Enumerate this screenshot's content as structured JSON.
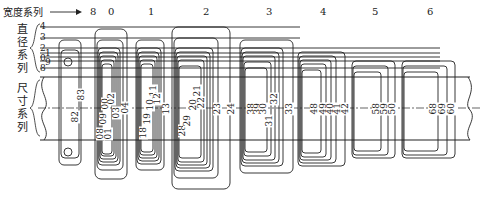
{
  "header": {
    "width_series_label": "宽度系列",
    "arrow": "→",
    "width_series": [
      "8",
      "0",
      "1",
      "2",
      "3",
      "4",
      "5",
      "6"
    ]
  },
  "left_labels": {
    "diameter_series_label": [
      "直",
      "径",
      "系",
      "列"
    ],
    "diameter_series_values": [
      "4",
      "3",
      "2",
      "1",
      "0",
      "9",
      "8"
    ],
    "dimension_series_label": [
      "尺",
      "寸",
      "系",
      "列"
    ]
  },
  "groups": [
    {
      "width": "8",
      "codes": [
        "82",
        "83"
      ]
    },
    {
      "width": "0",
      "codes": [
        "08",
        "09",
        "00",
        "01",
        "02",
        "03",
        "04"
      ]
    },
    {
      "width": "1",
      "codes": [
        "18",
        "19",
        "10",
        "11",
        "12",
        "13"
      ]
    },
    {
      "width": "2",
      "codes": [
        "28",
        "29",
        "20",
        "21",
        "22",
        "23",
        "24"
      ]
    },
    {
      "width": "3",
      "codes": [
        "38",
        "39",
        "30",
        "31",
        "32",
        "33"
      ]
    },
    {
      "width": "4",
      "codes": [
        "48",
        "49",
        "40",
        "41",
        "42"
      ]
    },
    {
      "width": "5",
      "codes": [
        "58",
        "59",
        "50"
      ]
    },
    {
      "width": "6",
      "codes": [
        "68",
        "69",
        "60"
      ]
    }
  ],
  "colors": {
    "line": "#222222",
    "background": "#ffffff"
  }
}
